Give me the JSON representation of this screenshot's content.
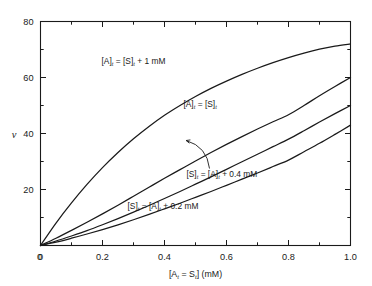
{
  "chart_data": {
    "type": "line",
    "title": "",
    "subtitle": "",
    "xlabel": "[A_t = S_t] (mM)",
    "xlabel_parts": {
      "open": "[A",
      "sub1": "t",
      "eq": " = S",
      "sub2": "t",
      "close": "] (mM)"
    },
    "ylabel": "v",
    "xlim": [
      0,
      1.0
    ],
    "ylim": [
      0,
      80
    ],
    "xticks": [
      0,
      0.2,
      0.4,
      0.6,
      0.8,
      1.0
    ],
    "xticklabels": [
      "0",
      "0.2",
      "0.4",
      "0.6",
      "0.8",
      "1.0"
    ],
    "xminorticks": [
      0.1,
      0.3,
      0.5,
      0.7,
      0.9
    ],
    "yticks": [
      0,
      20,
      40,
      60,
      80
    ],
    "yticklabels": [
      "0",
      "20",
      "40",
      "60",
      "80"
    ],
    "yminorticks": [
      10,
      30,
      50,
      70
    ],
    "grid": false,
    "legend": "none",
    "line_color": "#1a1a1a",
    "axis_color": "#1a1a1a",
    "series": [
      {
        "name": "[A]t = [S]t + 1 mM",
        "label_parts": {
          "a": "[A]",
          "asub": "t",
          "b": " = [S]",
          "bsub": "t",
          "c": " + 1 mM"
        },
        "label_x": 0.3,
        "label_y": 66.0,
        "values": [
          {
            "x": 0.0,
            "y": 0.0
          },
          {
            "x": 0.05,
            "y": 8.0
          },
          {
            "x": 0.1,
            "y": 15.2
          },
          {
            "x": 0.15,
            "y": 21.8
          },
          {
            "x": 0.2,
            "y": 27.8
          },
          {
            "x": 0.25,
            "y": 33.2
          },
          {
            "x": 0.3,
            "y": 38.1
          },
          {
            "x": 0.35,
            "y": 42.5
          },
          {
            "x": 0.4,
            "y": 46.5
          },
          {
            "x": 0.45,
            "y": 50.0
          },
          {
            "x": 0.5,
            "y": 53.2
          },
          {
            "x": 0.55,
            "y": 56.1
          },
          {
            "x": 0.6,
            "y": 58.7
          },
          {
            "x": 0.65,
            "y": 61.1
          },
          {
            "x": 0.7,
            "y": 63.3
          },
          {
            "x": 0.75,
            "y": 65.3
          },
          {
            "x": 0.8,
            "y": 67.1
          },
          {
            "x": 0.85,
            "y": 68.7
          },
          {
            "x": 0.9,
            "y": 70.1
          },
          {
            "x": 0.95,
            "y": 71.2
          },
          {
            "x": 1.0,
            "y": 72.0
          }
        ]
      },
      {
        "name": "[A]t = [S]t",
        "label_parts": {
          "a": "[A]",
          "asub": "t",
          "b": " = [S]",
          "bsub": "t",
          "c": ""
        },
        "label_x": 0.515,
        "label_y": 50.5,
        "values": [
          {
            "x": 0.0,
            "y": 0.0
          },
          {
            "x": 0.05,
            "y": 2.6
          },
          {
            "x": 0.1,
            "y": 5.4
          },
          {
            "x": 0.15,
            "y": 8.3
          },
          {
            "x": 0.2,
            "y": 11.3
          },
          {
            "x": 0.25,
            "y": 14.4
          },
          {
            "x": 0.3,
            "y": 17.6
          },
          {
            "x": 0.35,
            "y": 20.8
          },
          {
            "x": 0.4,
            "y": 24.0
          },
          {
            "x": 0.45,
            "y": 27.1
          },
          {
            "x": 0.5,
            "y": 30.2
          },
          {
            "x": 0.55,
            "y": 33.2
          },
          {
            "x": 0.6,
            "y": 36.1
          },
          {
            "x": 0.65,
            "y": 38.9
          },
          {
            "x": 0.7,
            "y": 41.6
          },
          {
            "x": 0.75,
            "y": 44.2
          },
          {
            "x": 0.8,
            "y": 46.7
          },
          {
            "x": 0.85,
            "y": 50.0
          },
          {
            "x": 0.9,
            "y": 53.5
          },
          {
            "x": 0.95,
            "y": 56.8
          },
          {
            "x": 1.0,
            "y": 60.0
          }
        ]
      },
      {
        "name": "[S]t = [A]t + 0.4 mM",
        "label_parts": {
          "a": "[S]",
          "asub": "t",
          "b": " = [A]",
          "bsub": "t",
          "c": " + 0.4 mM"
        },
        "label_x": 0.585,
        "label_y": 25.5,
        "pointer": {
          "from_x": 0.545,
          "from_y": 27.5,
          "to_x": 0.47,
          "to_y": 37.5
        },
        "values": [
          {
            "x": 0.0,
            "y": 0.0
          },
          {
            "x": 0.05,
            "y": 1.6
          },
          {
            "x": 0.1,
            "y": 3.4
          },
          {
            "x": 0.15,
            "y": 5.3
          },
          {
            "x": 0.2,
            "y": 7.4
          },
          {
            "x": 0.25,
            "y": 9.6
          },
          {
            "x": 0.3,
            "y": 11.9
          },
          {
            "x": 0.35,
            "y": 14.3
          },
          {
            "x": 0.4,
            "y": 16.8
          },
          {
            "x": 0.45,
            "y": 19.3
          },
          {
            "x": 0.5,
            "y": 21.9
          },
          {
            "x": 0.55,
            "y": 24.5
          },
          {
            "x": 0.6,
            "y": 27.2
          },
          {
            "x": 0.65,
            "y": 29.9
          },
          {
            "x": 0.7,
            "y": 32.6
          },
          {
            "x": 0.75,
            "y": 35.3
          },
          {
            "x": 0.8,
            "y": 38.0
          },
          {
            "x": 0.85,
            "y": 41.0
          },
          {
            "x": 0.9,
            "y": 44.1
          },
          {
            "x": 0.95,
            "y": 47.1
          },
          {
            "x": 1.0,
            "y": 50.0
          }
        ]
      },
      {
        "name": "[S]t = [A]t + 0.2 mM",
        "label_parts": {
          "a": "[S]",
          "asub": "t",
          "b": " = [A]",
          "bsub": "t",
          "c": " + 0.2 mM"
        },
        "label_x": 0.395,
        "label_y": 14.0,
        "values": [
          {
            "x": 0.0,
            "y": 0.0
          },
          {
            "x": 0.05,
            "y": 1.2
          },
          {
            "x": 0.1,
            "y": 2.6
          },
          {
            "x": 0.15,
            "y": 4.1
          },
          {
            "x": 0.2,
            "y": 5.7
          },
          {
            "x": 0.25,
            "y": 7.4
          },
          {
            "x": 0.3,
            "y": 9.2
          },
          {
            "x": 0.35,
            "y": 11.1
          },
          {
            "x": 0.4,
            "y": 13.1
          },
          {
            "x": 0.45,
            "y": 15.1
          },
          {
            "x": 0.5,
            "y": 17.2
          },
          {
            "x": 0.55,
            "y": 19.3
          },
          {
            "x": 0.6,
            "y": 21.5
          },
          {
            "x": 0.65,
            "y": 23.7
          },
          {
            "x": 0.7,
            "y": 25.9
          },
          {
            "x": 0.75,
            "y": 28.2
          },
          {
            "x": 0.8,
            "y": 30.5
          },
          {
            "x": 0.85,
            "y": 33.5
          },
          {
            "x": 0.9,
            "y": 36.5
          },
          {
            "x": 0.95,
            "y": 39.7
          },
          {
            "x": 1.0,
            "y": 43.0
          }
        ]
      }
    ]
  }
}
